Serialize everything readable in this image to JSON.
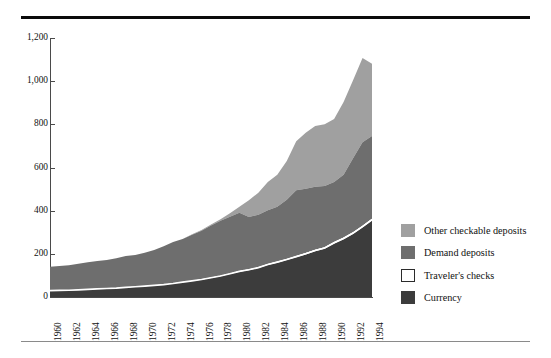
{
  "figure": {
    "has_top_rule": true,
    "has_bottom_rule": true
  },
  "chart_data": {
    "type": "area",
    "stacked": true,
    "title": "",
    "subtitle": "",
    "xlabel": "",
    "ylabel": "",
    "grid": false,
    "legend_position": "right",
    "xlim": [
      1960,
      1994
    ],
    "ylim": [
      0,
      1200
    ],
    "yticks": [
      0,
      200,
      400,
      600,
      800,
      1000,
      1200
    ],
    "ytick_labels": [
      "0",
      "200",
      "400",
      "600",
      "800",
      "1,000",
      "1,200"
    ],
    "x": [
      1960,
      1961,
      1962,
      1963,
      1964,
      1965,
      1966,
      1967,
      1968,
      1969,
      1970,
      1971,
      1972,
      1973,
      1974,
      1975,
      1976,
      1977,
      1978,
      1979,
      1980,
      1981,
      1982,
      1983,
      1984,
      1985,
      1986,
      1987,
      1988,
      1989,
      1990,
      1991,
      1992,
      1993,
      1994
    ],
    "xtick_labels": [
      "1960",
      "1962",
      "1964",
      "1966",
      "1968",
      "1970",
      "1972",
      "1974",
      "1976",
      "1978",
      "1980",
      "1982",
      "1984",
      "1986",
      "1988",
      "1990",
      "1992",
      "1994"
    ],
    "xticks": [
      1960,
      1962,
      1964,
      1966,
      1968,
      1970,
      1972,
      1974,
      1976,
      1978,
      1980,
      1982,
      1984,
      1986,
      1988,
      1990,
      1992,
      1994
    ],
    "series": [
      {
        "name": "Currency",
        "color": "#3c3c3c",
        "stack_order": 1,
        "values": [
          29,
          30,
          31,
          33,
          35,
          37,
          39,
          41,
          44,
          47,
          50,
          53,
          57,
          62,
          68,
          74,
          80,
          88,
          96,
          106,
          117,
          124,
          134,
          148,
          159,
          171,
          184,
          197,
          212,
          223,
          247,
          267,
          292,
          322,
          354
        ]
      },
      {
        "name": "Traveler's checks",
        "color": "#ffffff",
        "stack_order": 2,
        "values": [
          0.5,
          0.5,
          0.6,
          0.6,
          0.7,
          0.7,
          0.8,
          0.8,
          0.9,
          1.0,
          1.1,
          1.2,
          1.3,
          1.4,
          1.6,
          1.8,
          2.1,
          2.4,
          2.8,
          3.2,
          3.8,
          4.1,
          4.3,
          4.7,
          5.0,
          5.6,
          6.1,
          6.6,
          7.3,
          7.8,
          8.2,
          8.3,
          8.3,
          8.2,
          8.6
        ]
      },
      {
        "name": "Demand deposits",
        "color": "#6e6e6e",
        "stack_order": 3,
        "values": [
          111,
          113,
          116,
          120,
          125,
          129,
          132,
          138,
          145,
          147,
          154,
          163,
          177,
          191,
          199,
          213,
          225,
          241,
          254,
          263,
          269,
          242,
          243,
          249,
          254,
          274,
          304,
          298,
          292,
          283,
          278,
          291,
          343,
          387,
          383
        ]
      },
      {
        "name": "Other checkable deposits",
        "color": "#a0a0a0",
        "stack_order": 4,
        "values": [
          0,
          0,
          0,
          0,
          0,
          0,
          0,
          0,
          0,
          0,
          0,
          0,
          0,
          0,
          0.5,
          1.5,
          3,
          5,
          8,
          16,
          28,
          78,
          102,
          131,
          148,
          180,
          227,
          259,
          281,
          287,
          291,
          337,
          361,
          390,
          335
        ]
      }
    ]
  },
  "legend": {
    "items": [
      {
        "label": "Other checkable deposits",
        "color": "#a0a0a0",
        "outlined": false
      },
      {
        "label": "Demand deposits",
        "color": "#6e6e6e",
        "outlined": false
      },
      {
        "label": "Traveler's checks",
        "color": "#ffffff",
        "outlined": true
      },
      {
        "label": "Currency",
        "color": "#3c3c3c",
        "outlined": false
      }
    ]
  }
}
